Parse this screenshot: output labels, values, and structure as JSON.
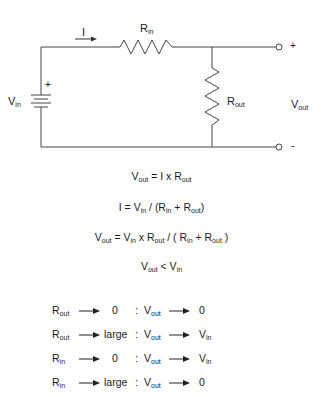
{
  "circuit": {
    "current_label": "I",
    "rin_label": {
      "main": "R",
      "sub": "in"
    },
    "rout_label": {
      "main": "R",
      "sub": "out"
    },
    "vin_label": {
      "main": "V",
      "sub": "in"
    },
    "vout_label": {
      "main": "V",
      "sub": "out"
    },
    "battery_polarity": "+",
    "terminal_plus": "+",
    "terminal_minus": "-"
  },
  "equations": [
    [
      {
        "t": "V"
      },
      {
        "s": "out"
      },
      {
        "t": " = I x R"
      },
      {
        "s": "out"
      }
    ],
    [
      {
        "t": "I = V"
      },
      {
        "s": "in"
      },
      {
        "t": " / (R"
      },
      {
        "s": "in"
      },
      {
        "t": " + R"
      },
      {
        "s": "out"
      },
      {
        "t": ")"
      }
    ],
    [
      {
        "t": "V"
      },
      {
        "s": "out"
      },
      {
        "t": " = V"
      },
      {
        "s": "in"
      },
      {
        "t": " x R"
      },
      {
        "s": "out"
      },
      {
        "t": " / ( R"
      },
      {
        "s": "in"
      },
      {
        "t": " + R"
      },
      {
        "s": "out"
      },
      {
        "t": " )"
      }
    ],
    [
      {
        "t": "V"
      },
      {
        "s": "out"
      },
      {
        "t": " < V"
      },
      {
        "s": "in"
      }
    ]
  ],
  "limits": [
    {
      "resistor": {
        "main": "R",
        "sub": "out"
      },
      "condition": "0",
      "separator": ":",
      "output": {
        "main": "V",
        "sub": "out"
      },
      "result": {
        "main": "0",
        "sub": ""
      }
    },
    {
      "resistor": {
        "main": "R",
        "sub": "out"
      },
      "condition": "large",
      "separator": ":",
      "output": {
        "main": "V",
        "sub": "out"
      },
      "result": {
        "main": "V",
        "sub": "in"
      }
    },
    {
      "resistor": {
        "main": "R",
        "sub": "in"
      },
      "condition": "0",
      "separator": ":",
      "output": {
        "main": "V",
        "sub": "out"
      },
      "result": {
        "main": "V",
        "sub": "in"
      }
    },
    {
      "resistor": {
        "main": "R",
        "sub": "in"
      },
      "condition": "large",
      "separator": ":",
      "output": {
        "main": "V",
        "sub": "out"
      },
      "result": {
        "main": "0",
        "sub": ""
      }
    }
  ]
}
